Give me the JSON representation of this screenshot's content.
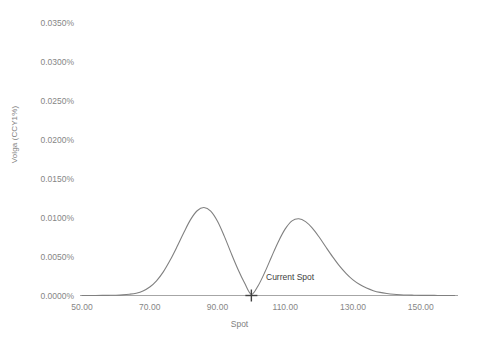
{
  "chart_data": {
    "type": "line",
    "title": "",
    "xlabel": "Spot",
    "ylabel": "Volga (CCY1%)",
    "xlim": [
      50.0,
      161.0
    ],
    "ylim": [
      0.0,
      0.035
    ],
    "grid": false,
    "legend_position": "none",
    "xtick_labels": [
      "50.00",
      "70.00",
      "90.00",
      "110.00",
      "130.00",
      "150.00"
    ],
    "xtick_values": [
      50.0,
      70.0,
      90.0,
      110.0,
      130.0,
      150.0
    ],
    "ytick_labels": [
      "0.0000%",
      "0.0050%",
      "0.0100%",
      "0.0150%",
      "0.0200%",
      "0.0250%",
      "0.0300%",
      "0.0350%"
    ],
    "ytick_values": [
      0.0,
      0.005,
      0.01,
      0.015,
      0.02,
      0.025,
      0.03,
      0.035
    ],
    "y_units": "percent",
    "line_color": "#808080",
    "line_width": 1.0,
    "series": [
      {
        "name": "Volga",
        "x": [
          50,
          52,
          54,
          56,
          58,
          60,
          62,
          64,
          66,
          68,
          70,
          72,
          74,
          76,
          78,
          80,
          82,
          84,
          86,
          88,
          90,
          92,
          94,
          96,
          98,
          100,
          102,
          104,
          106,
          108,
          110,
          112,
          114,
          116,
          118,
          120,
          122,
          124,
          126,
          128,
          130,
          132,
          134,
          136,
          138,
          140,
          142,
          144,
          146,
          148,
          150,
          152,
          154,
          156,
          158,
          160
        ],
        "y": [
          0.0,
          0.0,
          0.0,
          1e-05,
          2e-05,
          4e-05,
          8e-05,
          0.00016,
          0.0003,
          0.00058,
          0.00108,
          0.00188,
          0.00302,
          0.0045,
          0.0062,
          0.008,
          0.00968,
          0.01085,
          0.01126,
          0.0108,
          0.0095,
          0.0076,
          0.00545,
          0.0034,
          0.0016,
          0.00014,
          0.00125,
          0.003,
          0.005,
          0.00692,
          0.00852,
          0.00955,
          0.00982,
          0.00945,
          0.00862,
          0.00748,
          0.0062,
          0.00495,
          0.00378,
          0.0028,
          0.002,
          0.0014,
          0.00095,
          0.00062,
          0.0004,
          0.00026,
          0.00016,
          0.0001,
          6e-05,
          4e-05,
          2e-05,
          1e-05,
          1e-05,
          0.0,
          0.0,
          0.0
        ]
      }
    ],
    "peaks": [
      {
        "x": 86.0,
        "y": 0.0313,
        "label": "left peak"
      },
      {
        "x": 115.0,
        "y": 0.0272,
        "label": "right peak"
      }
    ],
    "minimum": {
      "x": 100.0,
      "y": 0.00014
    },
    "annotations": [
      {
        "name": "current-spot",
        "text": "Current Spot",
        "marker": "plus",
        "marker_color": "#404040",
        "x": 100.0,
        "y": 0.0
      }
    ]
  }
}
